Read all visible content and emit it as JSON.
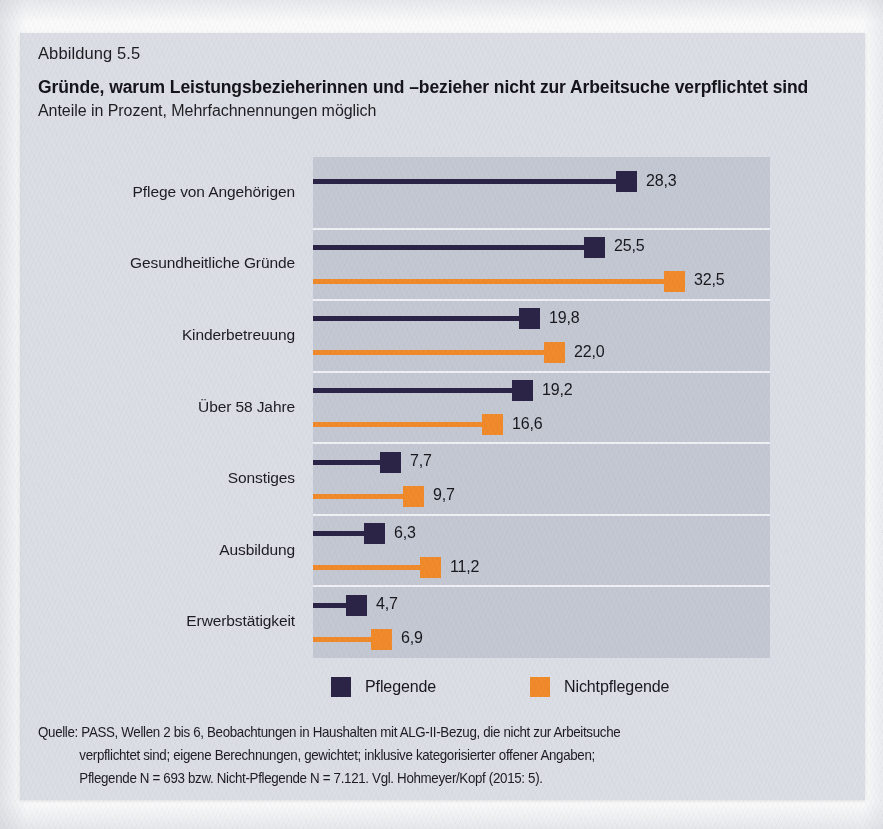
{
  "figure": {
    "number": "Abbildung 5.5",
    "title": "Gründe, warum Leistungsbezieherinnen und –bezieher nicht zur Arbeitsuche verpflichtet sind",
    "subtitle": "Anteile in Prozent, Mehrfachnennungen möglich"
  },
  "colors": {
    "page_background": "#fafafa",
    "panel_background": "#dcdee5",
    "plot_background": "#c4c8d3",
    "grid_line": "#f0f1f5",
    "series_pflegende": "#2b2447",
    "series_nichtpflegende": "#f08a2a",
    "text": "#18181e"
  },
  "legend": {
    "position": "bottom",
    "items": [
      {
        "label": "Pflegende",
        "color": "#2b2447"
      },
      {
        "label": "Nichtpflegende",
        "color": "#f08a2a"
      }
    ]
  },
  "source": {
    "lines": [
      "Quelle: PASS, Wellen 2 bis 6, Beobachtungen in Haushalten mit ALG-II-Bezug, die nicht zur Arbeitsuche",
      "verpflichtet sind; eigene Berechnungen, gewichtet; inklusive kategorisierter offener Angaben;",
      "Pflegende N = 693 bzw. Nicht-Pflegende N = 7.121. Vgl. Hohmeyer/Kopf (2015: 5)."
    ]
  },
  "chart_data": {
    "type": "bar",
    "orientation": "horizontal",
    "title": "Gründe, warum Leistungsbezieherinnen und –bezieher nicht zur Arbeitsuche verpflichtet sind",
    "subtitle": "Anteile in Prozent, Mehrfachnennungen möglich",
    "xlabel": "Anteile in Prozent",
    "ylabel": "",
    "xlim": [
      0,
      40
    ],
    "grid": "horizontal-row-dividers",
    "legend_position": "bottom",
    "value_format": "german-decimal-comma",
    "categories": [
      "Pflege von Angehörigen",
      "Gesundheitliche Gründe",
      "Kinderbetreuung",
      "Über 58 Jahre",
      "Sonstiges",
      "Ausbildung",
      "Erwerbstätigkeit"
    ],
    "series": [
      {
        "name": "Pflegende",
        "color": "#2b2447",
        "values": [
          28.3,
          25.5,
          19.8,
          19.2,
          7.7,
          6.3,
          4.7
        ],
        "labels": [
          "28,3",
          "25,5",
          "19,8",
          "19,2",
          "7,7",
          "6,3",
          "4,7"
        ]
      },
      {
        "name": "Nichtpflegende",
        "color": "#f08a2a",
        "values": [
          null,
          32.5,
          22.0,
          16.6,
          9.7,
          11.2,
          6.9
        ],
        "labels": [
          "",
          "32,5",
          "22,0",
          "16,6",
          "9,7",
          "11,2",
          "6,9"
        ]
      }
    ]
  }
}
